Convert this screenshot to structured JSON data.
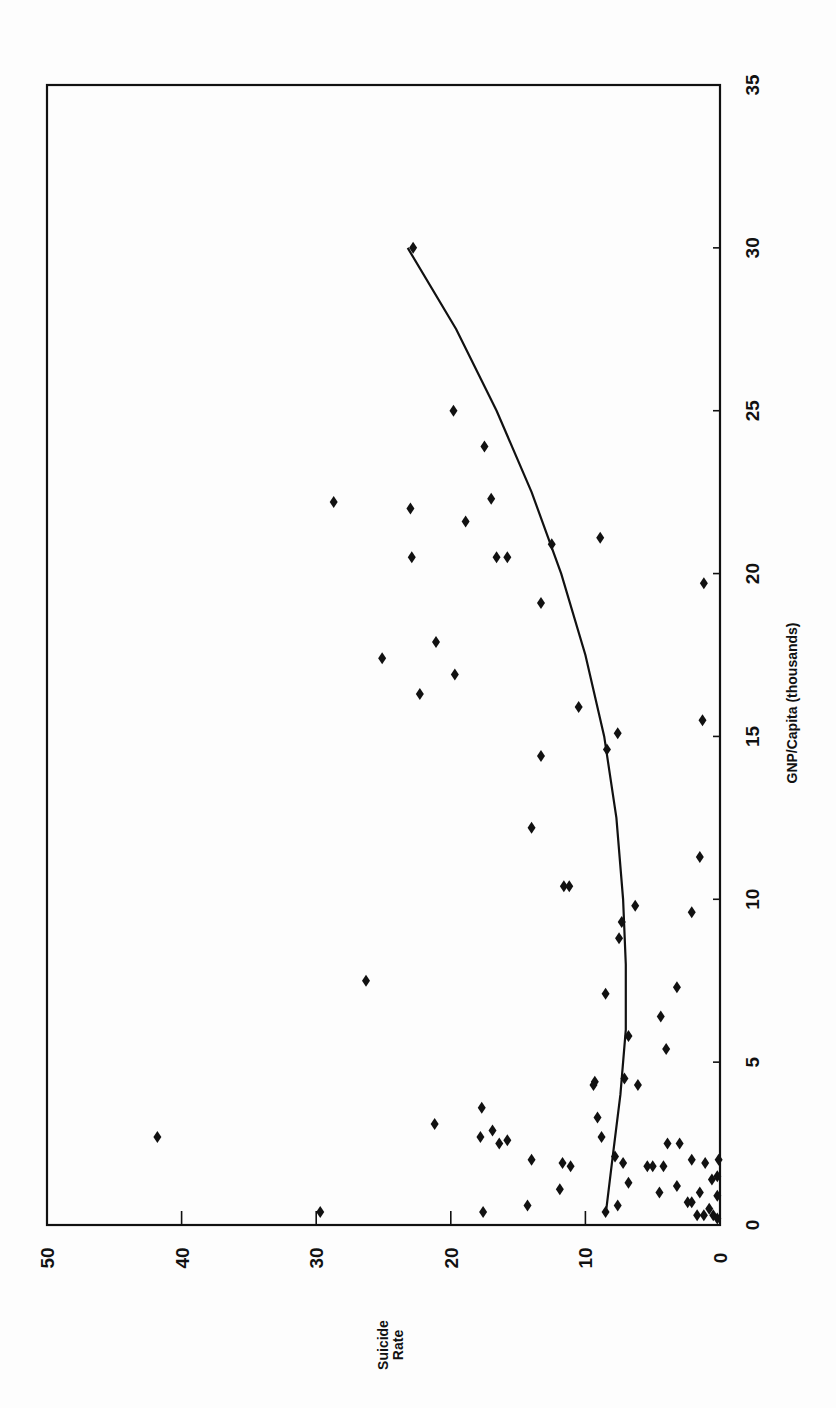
{
  "chart_data": {
    "type": "scatter",
    "title": "",
    "xlabel": "GNP/Capita (thousands)",
    "ylabel": "Suicide Rate",
    "ylabel_lines": [
      "Suicide",
      "Rate"
    ],
    "xlim": [
      0,
      35
    ],
    "ylim": [
      0,
      50
    ],
    "x_ticks": [
      0,
      5,
      10,
      15,
      20,
      25,
      30,
      35
    ],
    "y_ticks": [
      0,
      10,
      20,
      30,
      40,
      50
    ],
    "grid": false,
    "legend": null,
    "orientation": "rotated 90° counter-clockwise (GNP axis vertical on right, rate axis horizontal at bottom)",
    "marker": "diamond",
    "series": [
      {
        "name": "Countries",
        "points": [
          {
            "x": 30.0,
            "y": 22.8
          },
          {
            "x": 25.0,
            "y": 19.8
          },
          {
            "x": 23.9,
            "y": 17.5
          },
          {
            "x": 22.2,
            "y": 28.7
          },
          {
            "x": 22.0,
            "y": 23.0
          },
          {
            "x": 22.3,
            "y": 17.0
          },
          {
            "x": 21.6,
            "y": 18.9
          },
          {
            "x": 21.1,
            "y": 8.9
          },
          {
            "x": 20.9,
            "y": 12.5
          },
          {
            "x": 20.5,
            "y": 22.9
          },
          {
            "x": 20.5,
            "y": 16.6
          },
          {
            "x": 20.5,
            "y": 15.8
          },
          {
            "x": 19.7,
            "y": 1.2
          },
          {
            "x": 19.1,
            "y": 13.3
          },
          {
            "x": 17.9,
            "y": 21.1
          },
          {
            "x": 17.4,
            "y": 25.1
          },
          {
            "x": 16.9,
            "y": 19.7
          },
          {
            "x": 16.3,
            "y": 22.3
          },
          {
            "x": 15.9,
            "y": 10.5
          },
          {
            "x": 15.5,
            "y": 1.3
          },
          {
            "x": 15.1,
            "y": 7.6
          },
          {
            "x": 14.6,
            "y": 8.4
          },
          {
            "x": 14.4,
            "y": 13.3
          },
          {
            "x": 12.2,
            "y": 14.0
          },
          {
            "x": 11.3,
            "y": 1.5
          },
          {
            "x": 10.4,
            "y": 11.6
          },
          {
            "x": 10.4,
            "y": 11.2
          },
          {
            "x": 9.8,
            "y": 6.3
          },
          {
            "x": 9.6,
            "y": 2.1
          },
          {
            "x": 9.3,
            "y": 7.3
          },
          {
            "x": 8.8,
            "y": 7.5
          },
          {
            "x": 7.5,
            "y": 26.3
          },
          {
            "x": 7.3,
            "y": 3.2
          },
          {
            "x": 7.1,
            "y": 8.5
          },
          {
            "x": 6.4,
            "y": 4.4
          },
          {
            "x": 5.8,
            "y": 6.8
          },
          {
            "x": 5.4,
            "y": 4.0
          },
          {
            "x": 4.4,
            "y": 9.3
          },
          {
            "x": 4.3,
            "y": 9.4
          },
          {
            "x": 4.3,
            "y": 6.1
          },
          {
            "x": 4.5,
            "y": 7.1
          },
          {
            "x": 3.6,
            "y": 17.7
          },
          {
            "x": 3.3,
            "y": 9.1
          },
          {
            "x": 3.1,
            "y": 21.2
          },
          {
            "x": 2.9,
            "y": 16.9
          },
          {
            "x": 2.7,
            "y": 41.8
          },
          {
            "x": 2.7,
            "y": 17.8
          },
          {
            "x": 2.7,
            "y": 8.8
          },
          {
            "x": 2.6,
            "y": 15.8
          },
          {
            "x": 2.5,
            "y": 16.4
          },
          {
            "x": 2.5,
            "y": 3.9
          },
          {
            "x": 2.5,
            "y": 3.0
          },
          {
            "x": 2.1,
            "y": 7.8
          },
          {
            "x": 2.0,
            "y": 14.0
          },
          {
            "x": 2.0,
            "y": 2.1
          },
          {
            "x": 1.9,
            "y": 11.7
          },
          {
            "x": 1.9,
            "y": 7.2
          },
          {
            "x": 1.8,
            "y": 11.1
          },
          {
            "x": 1.8,
            "y": 5.4
          },
          {
            "x": 1.8,
            "y": 5.0
          },
          {
            "x": 1.8,
            "y": 4.2
          },
          {
            "x": 1.9,
            "y": 1.1
          },
          {
            "x": 1.3,
            "y": 6.8
          },
          {
            "x": 1.2,
            "y": 3.2
          },
          {
            "x": 1.1,
            "y": 11.9
          },
          {
            "x": 1.0,
            "y": 4.5
          },
          {
            "x": 1.0,
            "y": 1.5
          },
          {
            "x": 0.9,
            "y": 0.2
          },
          {
            "x": 0.7,
            "y": 2.1
          },
          {
            "x": 0.7,
            "y": 2.4
          },
          {
            "x": 0.6,
            "y": 14.3
          },
          {
            "x": 0.6,
            "y": 7.6
          },
          {
            "x": 0.5,
            "y": 0.8
          },
          {
            "x": 0.4,
            "y": 29.7
          },
          {
            "x": 0.4,
            "y": 17.6
          },
          {
            "x": 0.4,
            "y": 8.5
          },
          {
            "x": 0.3,
            "y": 1.7
          },
          {
            "x": 0.3,
            "y": 1.2
          },
          {
            "x": 0.3,
            "y": 0.5
          },
          {
            "x": 0.2,
            "y": 0.2
          },
          {
            "x": 1.5,
            "y": 0.2
          },
          {
            "x": 1.4,
            "y": 0.6
          },
          {
            "x": 2.0,
            "y": 0.1
          }
        ]
      }
    ],
    "trend_line": {
      "name": "Quadratic fit",
      "points": [
        {
          "x": 0.3,
          "y": 8.5
        },
        {
          "x": 2.0,
          "y": 8.0
        },
        {
          "x": 4.0,
          "y": 7.4
        },
        {
          "x": 6.0,
          "y": 7.0
        },
        {
          "x": 8.0,
          "y": 7.0
        },
        {
          "x": 10.0,
          "y": 7.2
        },
        {
          "x": 12.5,
          "y": 7.7
        },
        {
          "x": 15.0,
          "y": 8.6
        },
        {
          "x": 17.5,
          "y": 10.0
        },
        {
          "x": 20.0,
          "y": 11.8
        },
        {
          "x": 22.5,
          "y": 14.0
        },
        {
          "x": 25.0,
          "y": 16.6
        },
        {
          "x": 27.5,
          "y": 19.6
        },
        {
          "x": 30.0,
          "y": 23.2
        }
      ]
    }
  }
}
